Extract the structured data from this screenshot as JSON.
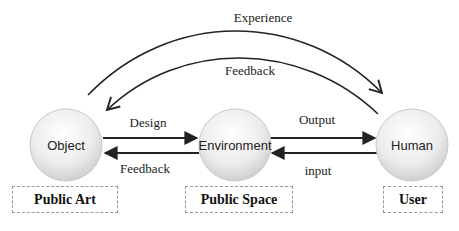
{
  "nodes": [
    {
      "id": "object",
      "label": "Object"
    },
    {
      "id": "environment",
      "label": "Environment"
    },
    {
      "id": "human",
      "label": "Human"
    }
  ],
  "categories": [
    {
      "label": "Public Art"
    },
    {
      "label": "Public Space"
    },
    {
      "label": "User"
    }
  ],
  "edges": {
    "experience": "Experience",
    "feedback_top": "Feedback",
    "design": "Design",
    "feedback_bottom": "Feedback",
    "output": "Output",
    "input": "input"
  },
  "colors": {
    "line": "#222222",
    "node_fill_light": "#ffffff",
    "node_fill_dark": "#cfcfcf",
    "node_stroke": "#c8c8c8",
    "box_border": "#999999"
  }
}
